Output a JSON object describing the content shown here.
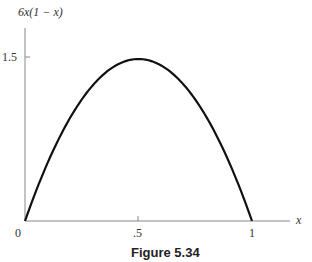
{
  "chart_data": {
    "type": "line",
    "title": "",
    "caption": "Figure 5.34",
    "function": "6x(1 - x)",
    "xlabel": "x",
    "ylabel": "6x(1 − x)",
    "xlim": [
      0,
      1
    ],
    "ylim": [
      0,
      1.5
    ],
    "x_ticks": [
      {
        "value": 0,
        "label": "0"
      },
      {
        "value": 0.5,
        "label": ".5"
      },
      {
        "value": 1,
        "label": "1"
      }
    ],
    "y_ticks": [
      {
        "value": 1.5,
        "label": "1.5"
      }
    ],
    "grid": false,
    "series": [
      {
        "name": "6x(1 - x)",
        "x": [
          0,
          0.1,
          0.2,
          0.3,
          0.4,
          0.5,
          0.6,
          0.7,
          0.8,
          0.9,
          1.0
        ],
        "y": [
          0,
          0.54,
          0.96,
          1.26,
          1.44,
          1.5,
          1.44,
          1.26,
          0.96,
          0.54,
          0
        ]
      }
    ]
  },
  "labels": {
    "ylabel": "6x(1 − x)",
    "xlabel": "x",
    "tick_y_15": "1.5",
    "tick_x_0": "0",
    "tick_x_05": ".5",
    "tick_x_1": "1",
    "caption": "Figure 5.34"
  }
}
